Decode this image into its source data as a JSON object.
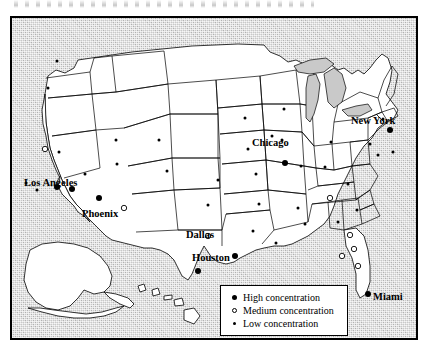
{
  "figure": {
    "title": "",
    "background_color": "#c9c9c9",
    "land_color": "#ffffff",
    "border_color": "#000000"
  },
  "legend": {
    "items": [
      {
        "marker": "filled-circle",
        "label": "High concentration",
        "level": "high"
      },
      {
        "marker": "open-circle",
        "label": "Medium concentration",
        "level": "medium"
      },
      {
        "marker": "small-dot",
        "label": "Low concentration",
        "level": "low"
      }
    ]
  },
  "city_labels": [
    {
      "name": "Los Angeles",
      "text": "Los Angeles",
      "x": 12,
      "y": 160
    },
    {
      "name": "Phoenix",
      "text": "Phoenix",
      "x": 70,
      "y": 191
    },
    {
      "name": "Dallas",
      "text": "Dallas",
      "x": 174,
      "y": 212
    },
    {
      "name": "Houston",
      "text": "Houston",
      "x": 180,
      "y": 235
    },
    {
      "name": "Chicago",
      "text": "Chicago",
      "x": 240,
      "y": 120
    },
    {
      "name": "New York",
      "text": "New York",
      "x": 339,
      "y": 98
    },
    {
      "name": "Miami",
      "text": "Miami",
      "x": 361,
      "y": 274
    }
  ],
  "chart_data": {
    "type": "map",
    "title": "",
    "region": "United States",
    "value_field": "concentration",
    "categories": [
      "High concentration",
      "Medium concentration",
      "Low concentration"
    ],
    "counts": {
      "high": 12,
      "medium": 9,
      "low": 31
    },
    "points": [
      {
        "x": 45,
        "y": 43,
        "level": "low"
      },
      {
        "x": 36,
        "y": 70,
        "level": "low"
      },
      {
        "x": 33,
        "y": 131,
        "level": "medium"
      },
      {
        "x": 14,
        "y": 165,
        "level": "low"
      },
      {
        "x": 25,
        "y": 172,
        "level": "low"
      },
      {
        "x": 47,
        "y": 134,
        "level": "low"
      },
      {
        "x": 45,
        "y": 169,
        "level": "high"
      },
      {
        "x": 60,
        "y": 171,
        "level": "high"
      },
      {
        "x": 73,
        "y": 156,
        "level": "low"
      },
      {
        "x": 87,
        "y": 180,
        "level": "high"
      },
      {
        "x": 104,
        "y": 122,
        "level": "low"
      },
      {
        "x": 112,
        "y": 190,
        "level": "medium"
      },
      {
        "x": 155,
        "y": 153,
        "level": "low"
      },
      {
        "x": 147,
        "y": 122,
        "level": "low"
      },
      {
        "x": 105,
        "y": 146,
        "level": "low"
      },
      {
        "x": 196,
        "y": 187,
        "level": "low"
      },
      {
        "x": 196,
        "y": 218,
        "level": "medium"
      },
      {
        "x": 223,
        "y": 238,
        "level": "high"
      },
      {
        "x": 186,
        "y": 253,
        "level": "high"
      },
      {
        "x": 206,
        "y": 162,
        "level": "low"
      },
      {
        "x": 233,
        "y": 100,
        "level": "low"
      },
      {
        "x": 236,
        "y": 131,
        "level": "low"
      },
      {
        "x": 244,
        "y": 156,
        "level": "low"
      },
      {
        "x": 247,
        "y": 186,
        "level": "low"
      },
      {
        "x": 241,
        "y": 213,
        "level": "low"
      },
      {
        "x": 270,
        "y": 122,
        "level": "low"
      },
      {
        "x": 272,
        "y": 91,
        "level": "low"
      },
      {
        "x": 273,
        "y": 145,
        "level": "high"
      },
      {
        "x": 289,
        "y": 148,
        "level": "low"
      },
      {
        "x": 286,
        "y": 190,
        "level": "low"
      },
      {
        "x": 264,
        "y": 225,
        "level": "low"
      },
      {
        "x": 293,
        "y": 206,
        "level": "low"
      },
      {
        "x": 313,
        "y": 149,
        "level": "low"
      },
      {
        "x": 319,
        "y": 124,
        "level": "low"
      },
      {
        "x": 336,
        "y": 166,
        "level": "low"
      },
      {
        "x": 318,
        "y": 180,
        "level": "medium"
      },
      {
        "x": 326,
        "y": 204,
        "level": "low"
      },
      {
        "x": 345,
        "y": 192,
        "level": "low"
      },
      {
        "x": 338,
        "y": 217,
        "level": "medium"
      },
      {
        "x": 330,
        "y": 238,
        "level": "medium"
      },
      {
        "x": 342,
        "y": 231,
        "level": "medium"
      },
      {
        "x": 346,
        "y": 248,
        "level": "medium"
      },
      {
        "x": 356,
        "y": 276,
        "level": "high"
      },
      {
        "x": 358,
        "y": 126,
        "level": "low"
      },
      {
        "x": 366,
        "y": 137,
        "level": "low"
      },
      {
        "x": 378,
        "y": 112,
        "level": "high"
      },
      {
        "x": 371,
        "y": 101,
        "level": "low"
      },
      {
        "x": 381,
        "y": 134,
        "level": "low"
      },
      {
        "x": 260,
        "y": 118,
        "level": "low"
      }
    ]
  }
}
